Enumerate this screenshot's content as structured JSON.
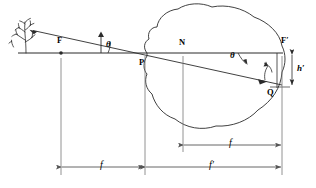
{
  "figure": {
    "type": "optical-ray-diagram",
    "stroke_color": "#2b2b2b",
    "background_color": "#ffffff",
    "labels": {
      "front_focal_point": "F",
      "principal_point": "P",
      "nodal_point": "N",
      "rear_focal_point": "F′",
      "image_point": "Q",
      "angle_object": "θ",
      "angle_image": "θ",
      "image_height": "h′",
      "front_focal_length": "f",
      "rear_focal_length_inner": "f",
      "rear_focal_length": "f′"
    },
    "elements": {
      "object": "tree-object",
      "optic": "eye-globe",
      "axis": "optical-axis",
      "incident_ray": "incident-ray-from-tree",
      "refracted_ray": "ray-through-nodal-point"
    },
    "geometry": {
      "axis_y": 53,
      "axis_x_start": 18,
      "axis_x_end": 283,
      "F_x": 61,
      "P_x": 145,
      "N_x": 183,
      "Fp_x": 282,
      "Q_x": 272,
      "Q_y": 87,
      "dim_f_y": 167,
      "dim_fprime_y": 167,
      "dim_f_inner_y": 145
    }
  }
}
